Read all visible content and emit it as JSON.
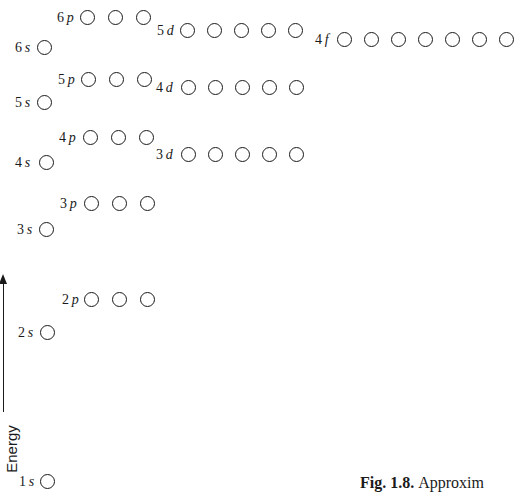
{
  "axis": {
    "label": "Energy",
    "direction": "up"
  },
  "caption": {
    "fig_label": "Fig. 1.8.",
    "text": "Approxim"
  },
  "subshells": [
    {
      "name": "1s",
      "n": "1",
      "l": "s",
      "orbitals": 1,
      "label_x": 19,
      "y": 474,
      "x0": 40,
      "spacing": 27
    },
    {
      "name": "2s",
      "n": "2",
      "l": "s",
      "orbitals": 1,
      "label_x": 18,
      "y": 325,
      "x0": 40,
      "spacing": 27
    },
    {
      "name": "2p",
      "n": "2",
      "l": "p",
      "orbitals": 3,
      "label_x": 62,
      "y": 292,
      "x0": 84,
      "spacing": 28
    },
    {
      "name": "3s",
      "n": "3",
      "l": "s",
      "orbitals": 1,
      "label_x": 17,
      "y": 222,
      "x0": 39,
      "spacing": 27
    },
    {
      "name": "3p",
      "n": "3",
      "l": "p",
      "orbitals": 3,
      "label_x": 60,
      "y": 196,
      "x0": 84,
      "spacing": 28
    },
    {
      "name": "4s",
      "n": "4",
      "l": "s",
      "orbitals": 1,
      "label_x": 15,
      "y": 155,
      "x0": 39,
      "spacing": 27
    },
    {
      "name": "4p",
      "n": "4",
      "l": "p",
      "orbitals": 3,
      "label_x": 59,
      "y": 130,
      "x0": 83,
      "spacing": 28
    },
    {
      "name": "3d",
      "n": "3",
      "l": "d",
      "orbitals": 5,
      "label_x": 156,
      "y": 147,
      "x0": 181,
      "spacing": 27
    },
    {
      "name": "5s",
      "n": "5",
      "l": "s",
      "orbitals": 1,
      "label_x": 15,
      "y": 95,
      "x0": 37,
      "spacing": 27
    },
    {
      "name": "5p",
      "n": "5",
      "l": "p",
      "orbitals": 3,
      "label_x": 58,
      "y": 72,
      "x0": 81,
      "spacing": 28
    },
    {
      "name": "4d",
      "n": "4",
      "l": "d",
      "orbitals": 5,
      "label_x": 156,
      "y": 80,
      "x0": 181,
      "spacing": 27
    },
    {
      "name": "6s",
      "n": "6",
      "l": "s",
      "orbitals": 1,
      "label_x": 15,
      "y": 40,
      "x0": 37,
      "spacing": 27
    },
    {
      "name": "6p",
      "n": "6",
      "l": "p",
      "orbitals": 3,
      "label_x": 57,
      "y": 10,
      "x0": 80,
      "spacing": 28
    },
    {
      "name": "5d",
      "n": "5",
      "l": "d",
      "orbitals": 5,
      "label_x": 157,
      "y": 23,
      "x0": 180,
      "spacing": 27
    },
    {
      "name": "4f",
      "n": "4",
      "l": "f",
      "orbitals": 7,
      "label_x": 315,
      "y": 32,
      "x0": 337,
      "spacing": 27
    }
  ]
}
